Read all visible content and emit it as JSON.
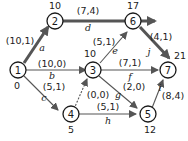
{
  "diagram": {
    "type": "activity-network",
    "colors": {
      "line": "#555555",
      "node_stroke": "#1a1a1a",
      "text": "#222222"
    },
    "nodes": [
      {
        "id": "1",
        "label": "1",
        "time": "0"
      },
      {
        "id": "2",
        "label": "2",
        "time": "10"
      },
      {
        "id": "3",
        "label": "3",
        "time": "10"
      },
      {
        "id": "4",
        "label": "4",
        "time": "5"
      },
      {
        "id": "5",
        "label": "5",
        "time": "12"
      },
      {
        "id": "6",
        "label": "6",
        "time": "17"
      },
      {
        "id": "7",
        "label": "7",
        "time": "21"
      }
    ],
    "edges": [
      {
        "name": "a",
        "from": "1",
        "to": "2",
        "weight": "(10,1)",
        "critical": true
      },
      {
        "name": "b",
        "from": "1",
        "to": "3",
        "weight": "(10,0)",
        "critical": false
      },
      {
        "name": "c",
        "from": "1",
        "to": "4",
        "weight": "(5,1)",
        "critical": false
      },
      {
        "name": "d",
        "from": "2",
        "to": "6",
        "weight": "(7,4)",
        "critical": true
      },
      {
        "name": "e",
        "from": "3",
        "to": "6",
        "weight": "(5,1)",
        "critical": false
      },
      {
        "name": "f",
        "from": "3",
        "to": "7",
        "weight": "(7,1)",
        "critical": false
      },
      {
        "name": "g",
        "from": "3",
        "to": "5",
        "weight": "(2,0)",
        "critical": false
      },
      {
        "name": "h",
        "from": "4",
        "to": "5",
        "weight": "(5,1)",
        "critical": false
      },
      {
        "name": "dummy",
        "from": "4",
        "to": "3",
        "weight": "(0,0)",
        "critical": false
      },
      {
        "name": "i",
        "from": "5",
        "to": "7",
        "weight": "(8,4)",
        "critical": false
      },
      {
        "name": "j",
        "from": "6",
        "to": "7",
        "weight": "(4,1)",
        "critical": true
      }
    ]
  }
}
